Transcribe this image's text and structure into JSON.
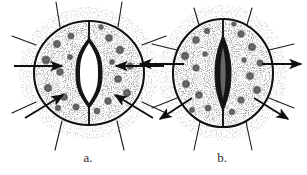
{
  "figure": {
    "background_color": "#ffffff",
    "ink_color": "#1a1a1a",
    "stipple_color": "#3a3a3a",
    "panel_count": 2
  },
  "panels": [
    {
      "id": "a",
      "caption": "a.",
      "caption_x": 88,
      "caption_y": 162,
      "state": "open",
      "state_label": "open stoma",
      "center_x": 89,
      "center_y": 73,
      "cell_rx": 55,
      "cell_ry": 52,
      "pore": {
        "shape": "lens",
        "label": "stomatal pore (open)",
        "half_width": 9,
        "half_height": 35,
        "fill": "#ffffff",
        "wall_fill": "#1a1a1a"
      },
      "arrows": [
        {
          "name": "turgor-arrow-left",
          "direction": "inward",
          "x1": 14,
          "y1": 66,
          "x2": 62,
          "y2": 66
        },
        {
          "name": "turgor-arrow-right",
          "direction": "inward",
          "x1": 164,
          "y1": 66,
          "x2": 116,
          "y2": 66
        },
        {
          "name": "turgor-arrow-lower-left",
          "direction": "inward",
          "x1": 25,
          "y1": 118,
          "x2": 63,
          "y2": 95
        },
        {
          "name": "turgor-arrow-lower-right",
          "direction": "inward",
          "x1": 153,
          "y1": 118,
          "x2": 115,
          "y2": 95
        }
      ],
      "chloroplast_count": 18
    },
    {
      "id": "b",
      "caption": "b.",
      "caption_x": 222,
      "caption_y": 162,
      "state": "closed",
      "state_label": "closed stoma",
      "center_x": 223,
      "center_y": 73,
      "cell_rx": 50,
      "cell_ry": 54,
      "pore": {
        "shape": "spindle",
        "label": "stomatal pore (closed)",
        "half_width": 5,
        "half_height": 38,
        "fill": "#1a1a1a",
        "wall_fill": "#1a1a1a"
      },
      "arrows": [
        {
          "name": "turgor-arrow-left",
          "direction": "outward",
          "x1": 184,
          "y1": 64,
          "x2": 140,
          "y2": 64
        },
        {
          "name": "turgor-arrow-right",
          "direction": "outward",
          "x1": 262,
          "y1": 64,
          "x2": 301,
          "y2": 64
        },
        {
          "name": "turgor-arrow-lower-left",
          "direction": "outward",
          "x1": 192,
          "y1": 98,
          "x2": 160,
          "y2": 119
        },
        {
          "name": "turgor-arrow-lower-right",
          "direction": "outward",
          "x1": 254,
          "y1": 98,
          "x2": 288,
          "y2": 119
        }
      ],
      "chloroplast_count": 18
    }
  ]
}
